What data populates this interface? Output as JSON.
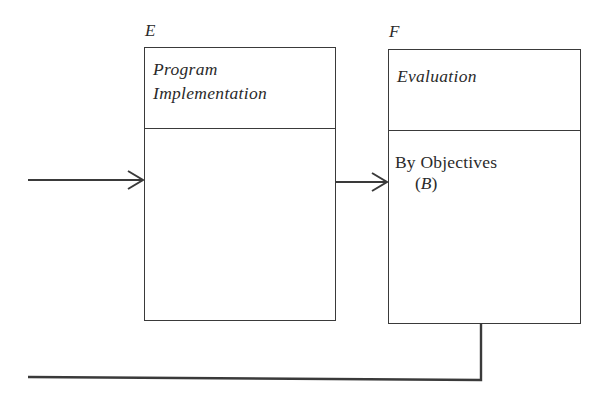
{
  "diagram": {
    "boxes": [
      {
        "id": "E",
        "letter": "E",
        "title_line1": "Program",
        "title_line2": "Implementation",
        "body_line1": "",
        "body_sub_open": "",
        "body_sub_ital": "",
        "body_sub_close": ""
      },
      {
        "id": "F",
        "letter": "F",
        "title_line1": "Evaluation",
        "title_line2": "",
        "body_line1": "By Objectives",
        "body_sub_open": "(",
        "body_sub_ital": "B",
        "body_sub_close": ")"
      }
    ],
    "connectors": [
      {
        "name": "input-arrow",
        "from": "left-edge",
        "to": "E",
        "arrowhead": true
      },
      {
        "name": "e-to-f-arrow",
        "from": "E",
        "to": "F",
        "arrowhead": true
      },
      {
        "name": "feedback-line",
        "from": "F",
        "to": "left-edge",
        "arrowhead": false
      }
    ],
    "colors": {
      "line": "#3a3a3a",
      "text": "#2a2a2a",
      "background": "#ffffff"
    }
  }
}
